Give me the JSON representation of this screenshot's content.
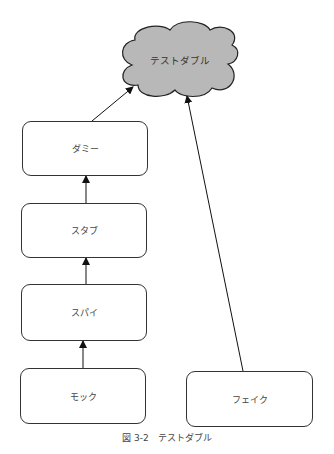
{
  "diagram": {
    "root": {
      "label": "テストダブル",
      "shape": "cloud",
      "fill": "#b8b8b8"
    },
    "nodes": [
      {
        "id": "dummy",
        "label": "ダミー"
      },
      {
        "id": "stub",
        "label": "スタブ"
      },
      {
        "id": "spy",
        "label": "スパイ"
      },
      {
        "id": "mock",
        "label": "モック"
      },
      {
        "id": "fake",
        "label": "フェイク"
      }
    ],
    "edges": [
      {
        "from": "mock",
        "to": "spy"
      },
      {
        "from": "spy",
        "to": "stub"
      },
      {
        "from": "stub",
        "to": "dummy"
      },
      {
        "from": "dummy",
        "to": "root"
      },
      {
        "from": "fake",
        "to": "root"
      }
    ]
  },
  "caption": "図 3-2　テストダブル"
}
